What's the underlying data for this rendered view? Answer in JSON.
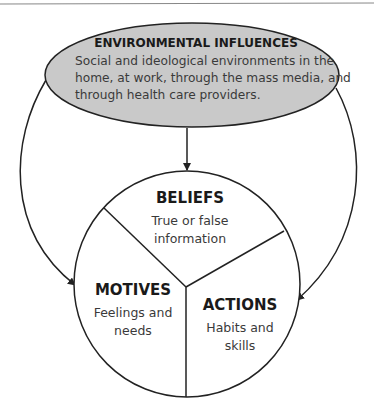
{
  "diagram": {
    "colors": {
      "ellipse_fill": "#c9c9c9",
      "stroke": "#222222",
      "title_text": "#1a1a1a",
      "body_text": "#3a3a3a",
      "top_rule": "#888888"
    },
    "environment": {
      "title": "ENVIRONMENTAL INFLUENCES",
      "lines": [
        "Social and ideological environments in the",
        "home, at work, through the mass media, and",
        "through health care providers."
      ]
    },
    "beliefs": {
      "title": "BELIEFS",
      "lines": [
        "True or false",
        "information"
      ]
    },
    "motives": {
      "title": "MOTIVES",
      "lines": [
        "Feelings and",
        "needs"
      ]
    },
    "actions": {
      "title": "ACTIONS",
      "lines": [
        "Habits and",
        "skills"
      ]
    },
    "arrows": [
      {
        "from": "environment",
        "to": "beliefs"
      },
      {
        "from": "environment",
        "to": "motives"
      },
      {
        "from": "environment",
        "to": "actions"
      }
    ]
  }
}
